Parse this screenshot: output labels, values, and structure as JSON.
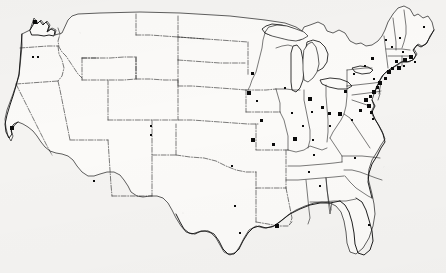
{
  "figure": {
    "marker_shape": "square",
    "marker_count": 68,
    "width_px": 446,
    "height_px": 273
  },
  "colors": {
    "background": "#f4f3f1",
    "land_fill": "#fbfaf8",
    "outline": "#141414",
    "state_border": "#232323",
    "marker": "#0b0b0b"
  },
  "chart_data": {
    "type": "scatter",
    "xlabel": "",
    "ylabel": "",
    "xlim": [
      0,
      446
    ],
    "ylim": [
      0,
      273
    ],
    "grid": false,
    "legend": "none",
    "series": [
      {
        "name": "sites",
        "marker": "square",
        "points": [
          {
            "x": 35,
            "y": 22,
            "size": 4.0,
            "label": "Puget Sound"
          },
          {
            "x": 33,
            "y": 57,
            "size": 2.6,
            "label": "Oregon west"
          },
          {
            "x": 38,
            "y": 57,
            "size": 2.6,
            "label": "Oregon east"
          },
          {
            "x": 12,
            "y": 128,
            "size": 3.6,
            "label": "San Francisco Bay"
          },
          {
            "x": 94,
            "y": 181,
            "size": 2.8,
            "label": "Arizona"
          },
          {
            "x": 151,
            "y": 126,
            "size": 2.6,
            "label": "Colorado north"
          },
          {
            "x": 151,
            "y": 135,
            "size": 2.6,
            "label": "Colorado south"
          },
          {
            "x": 232,
            "y": 166,
            "size": 2.6,
            "label": "Kansas"
          },
          {
            "x": 235,
            "y": 206,
            "size": 2.6,
            "label": "Texas north"
          },
          {
            "x": 240,
            "y": 233,
            "size": 2.6,
            "label": "Texas gulf"
          },
          {
            "x": 252,
            "y": 73,
            "size": 3.0,
            "label": "Minnesota"
          },
          {
            "x": 249,
            "y": 93,
            "size": 3.4,
            "label": "Iowa north"
          },
          {
            "x": 257,
            "y": 101,
            "size": 2.6,
            "label": "Iowa"
          },
          {
            "x": 261,
            "y": 120,
            "size": 3.0,
            "label": "Missouri west"
          },
          {
            "x": 253,
            "y": 140,
            "size": 3.4,
            "label": "Missouri"
          },
          {
            "x": 273,
            "y": 144,
            "size": 3.0,
            "label": "Missouri east"
          },
          {
            "x": 285,
            "y": 88,
            "size": 2.8,
            "label": "Wisconsin"
          },
          {
            "x": 292,
            "y": 113,
            "size": 2.8,
            "label": "Illinois north"
          },
          {
            "x": 303,
            "y": 126,
            "size": 2.8,
            "label": "Illinois central"
          },
          {
            "x": 295,
            "y": 139,
            "size": 3.2,
            "label": "Illinois south"
          },
          {
            "x": 313,
            "y": 140,
            "size": 2.8,
            "label": "Indiana"
          },
          {
            "x": 312,
            "y": 112,
            "size": 2.8,
            "label": "Indiana north"
          },
          {
            "x": 310,
            "y": 99,
            "size": 3.2,
            "label": "Michigan south"
          },
          {
            "x": 322,
            "y": 107,
            "size": 3.0,
            "label": "Ohio northwest"
          },
          {
            "x": 329,
            "y": 113,
            "size": 3.0,
            "label": "Ohio"
          },
          {
            "x": 340,
            "y": 114,
            "size": 4.2,
            "label": "Ohio northeast"
          },
          {
            "x": 330,
            "y": 126,
            "size": 2.8,
            "label": "Ohio south"
          },
          {
            "x": 314,
            "y": 155,
            "size": 2.8,
            "label": "Kentucky"
          },
          {
            "x": 309,
            "y": 172,
            "size": 2.8,
            "label": "Tennessee"
          },
          {
            "x": 320,
            "y": 186,
            "size": 2.6,
            "label": "Alabama north"
          },
          {
            "x": 277,
            "y": 226,
            "size": 4.0,
            "label": "New Orleans"
          },
          {
            "x": 369,
            "y": 225,
            "size": 2.8,
            "label": "Florida central"
          },
          {
            "x": 355,
            "y": 158,
            "size": 2.6,
            "label": "North Carolina"
          },
          {
            "x": 345,
            "y": 91,
            "size": 3.0,
            "label": "Pennsylvania west"
          },
          {
            "x": 352,
            "y": 120,
            "size": 2.6,
            "label": "Virginia west"
          },
          {
            "x": 360,
            "y": 110,
            "size": 3.0,
            "label": "Virginia"
          },
          {
            "x": 366,
            "y": 100,
            "size": 3.4,
            "label": "Washington DC"
          },
          {
            "x": 369,
            "y": 106,
            "size": 3.2,
            "label": "Chesapeake"
          },
          {
            "x": 371,
            "y": 112,
            "size": 3.0,
            "label": "Virginia east"
          },
          {
            "x": 373,
            "y": 119,
            "size": 2.8,
            "label": "Hampton Roads"
          },
          {
            "x": 370,
            "y": 96,
            "size": 3.0,
            "label": "Baltimore"
          },
          {
            "x": 374,
            "y": 92,
            "size": 3.4,
            "label": "Maryland north"
          },
          {
            "x": 377,
            "y": 87,
            "size": 3.0,
            "label": "Delaware"
          },
          {
            "x": 380,
            "y": 83,
            "size": 3.4,
            "label": "Philadelphia"
          },
          {
            "x": 374,
            "y": 79,
            "size": 2.8,
            "label": "Pennsylvania southeast"
          },
          {
            "x": 385,
            "y": 78,
            "size": 3.0,
            "label": "New Jersey"
          },
          {
            "x": 389,
            "y": 72,
            "size": 3.6,
            "label": "New York City"
          },
          {
            "x": 392,
            "y": 68,
            "size": 3.0,
            "label": "Long Island west"
          },
          {
            "x": 399,
            "y": 68,
            "size": 3.2,
            "label": "Long Island"
          },
          {
            "x": 404,
            "y": 66,
            "size": 2.8,
            "label": "Connecticut coast"
          },
          {
            "x": 396,
            "y": 61,
            "size": 3.0,
            "label": "Connecticut"
          },
          {
            "x": 405,
            "y": 60,
            "size": 3.2,
            "label": "Rhode Island"
          },
          {
            "x": 411,
            "y": 57,
            "size": 3.4,
            "label": "Boston"
          },
          {
            "x": 415,
            "y": 62,
            "size": 2.8,
            "label": "Cape Cod"
          },
          {
            "x": 403,
            "y": 52,
            "size": 2.6,
            "label": "Massachusetts north"
          },
          {
            "x": 392,
            "y": 47,
            "size": 2.8,
            "label": "New Hampshire"
          },
          {
            "x": 400,
            "y": 38,
            "size": 2.6,
            "label": "New Hampshire north"
          },
          {
            "x": 372,
            "y": 58,
            "size": 3.0,
            "label": "New York east"
          },
          {
            "x": 365,
            "y": 66,
            "size": 2.8,
            "label": "Pennsylvania northeast"
          },
          {
            "x": 354,
            "y": 74,
            "size": 2.8,
            "label": "Pennsylvania central"
          },
          {
            "x": 386,
            "y": 40,
            "size": 2.6,
            "label": "Vermont"
          },
          {
            "x": 424,
            "y": 27,
            "size": 2.6,
            "label": "Maine"
          }
        ]
      }
    ]
  }
}
